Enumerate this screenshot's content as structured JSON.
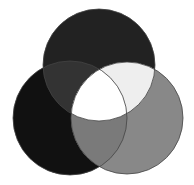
{
  "diagram": {
    "type": "three-circle-venn",
    "background": "#ffffff",
    "circles": [
      {
        "id": "top",
        "cx": 99,
        "cy": 65,
        "r": 56,
        "color": "#222222"
      },
      {
        "id": "left",
        "cx": 70,
        "cy": 118,
        "r": 57,
        "color": "#111111"
      },
      {
        "id": "right",
        "cx": 127,
        "cy": 118,
        "r": 56,
        "color": "#888888"
      }
    ],
    "regions": {
      "top_left": "#333333",
      "top_right": "#eeeeee",
      "left_right": "#7a7a7a",
      "center": "#ffffff"
    },
    "stroke": "#444444"
  }
}
